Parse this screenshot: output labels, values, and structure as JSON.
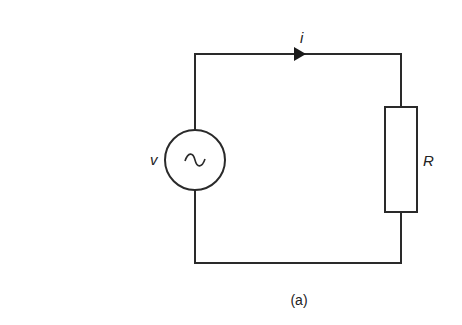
{
  "diagram": {
    "type": "circuit",
    "caption": "(a)",
    "components": {
      "source": {
        "kind": "ac-voltage-source",
        "label": "v",
        "symbol": "~"
      },
      "resistor": {
        "kind": "resistor",
        "label": "R"
      },
      "current": {
        "label": "i",
        "direction": "clockwise"
      }
    },
    "colors": {
      "line": "#2a2a2a",
      "background": "#ffffff"
    }
  }
}
